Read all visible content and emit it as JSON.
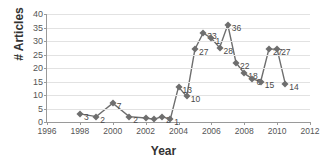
{
  "chart_data": {
    "type": "line",
    "title": "",
    "xlabel": "Year",
    "ylabel": "# Articles",
    "xlim": [
      1996,
      2012
    ],
    "ylim": [
      0,
      40
    ],
    "xticks": [
      1996,
      1998,
      2000,
      2002,
      2004,
      2006,
      2008,
      2010,
      2012
    ],
    "yticks": [
      0,
      5,
      10,
      15,
      20,
      25,
      30,
      35,
      40
    ],
    "grid": true,
    "legend": false,
    "marker": "diamond",
    "line_color": "#6e6e6e",
    "marker_color": "#6e6e6e",
    "grid_color": "#e2e2e2",
    "axis_color": "#9a9a9a",
    "x": [
      1998.0,
      1999.0,
      2000.0,
      2001.0,
      2002.0,
      2002.5,
      2003.0,
      2003.5,
      2004.0,
      2004.5,
      2005.0,
      2005.5,
      2006.0,
      2006.5,
      2007.0,
      2007.5,
      2008.0,
      2008.5,
      2009.0,
      2009.5,
      2010.0,
      2010.5
    ],
    "y": [
      3,
      2,
      7,
      2,
      1.5,
      1,
      2,
      1,
      13,
      9.5,
      27,
      33,
      31,
      27.5,
      36,
      22,
      18,
      16,
      15,
      27,
      27,
      14
    ],
    "point_labels": [
      "3",
      "2",
      "7",
      "2",
      "",
      "",
      "2",
      "1",
      "13",
      "10",
      "27",
      "33",
      "1",
      "28",
      "36",
      "22",
      "18",
      "6",
      "15",
      "27",
      "27",
      "14"
    ]
  },
  "axis": {
    "y_title": "# Articles",
    "x_title": "Year"
  }
}
